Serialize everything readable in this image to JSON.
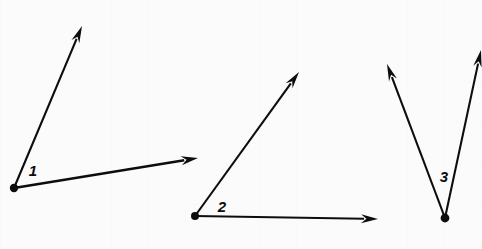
{
  "figure": {
    "background_color": "#fbfbfb",
    "ink_color": "#0d0d0d",
    "width": 482,
    "height": 249,
    "angles": [
      {
        "label": "1",
        "label_x": 33,
        "label_y": 176,
        "vertex_x": 14,
        "vertex_y": 188,
        "vertex_radius": 4.2,
        "rays": [
          {
            "name": "ray-1-upper",
            "tip_x": 82,
            "tip_y": 26,
            "stroke_width": 2.1,
            "head_length": 17,
            "head_width": 8.5
          },
          {
            "name": "ray-1-right",
            "tip_x": 198,
            "tip_y": 158,
            "stroke_width": 2.4,
            "head_length": 17,
            "head_width": 9
          }
        ]
      },
      {
        "label": "2",
        "label_x": 222,
        "label_y": 212,
        "vertex_x": 195,
        "vertex_y": 216,
        "vertex_radius": 4.0,
        "rays": [
          {
            "name": "ray-2-upper",
            "tip_x": 299,
            "tip_y": 72,
            "stroke_width": 2.1,
            "head_length": 17,
            "head_width": 8.5
          },
          {
            "name": "ray-2-right",
            "tip_x": 378,
            "tip_y": 219,
            "stroke_width": 2.2,
            "head_length": 17,
            "head_width": 9
          }
        ]
      },
      {
        "label": "3",
        "label_x": 444,
        "label_y": 182,
        "vertex_x": 445,
        "vertex_y": 218,
        "vertex_radius": 4.4,
        "rays": [
          {
            "name": "ray-3-left",
            "tip_x": 387,
            "tip_y": 64,
            "stroke_width": 2.1,
            "head_length": 17,
            "head_width": 8.5
          },
          {
            "name": "ray-3-right",
            "tip_x": 481,
            "tip_y": 50,
            "stroke_width": 2.1,
            "head_length": 17,
            "head_width": 8.5
          }
        ]
      }
    ]
  }
}
